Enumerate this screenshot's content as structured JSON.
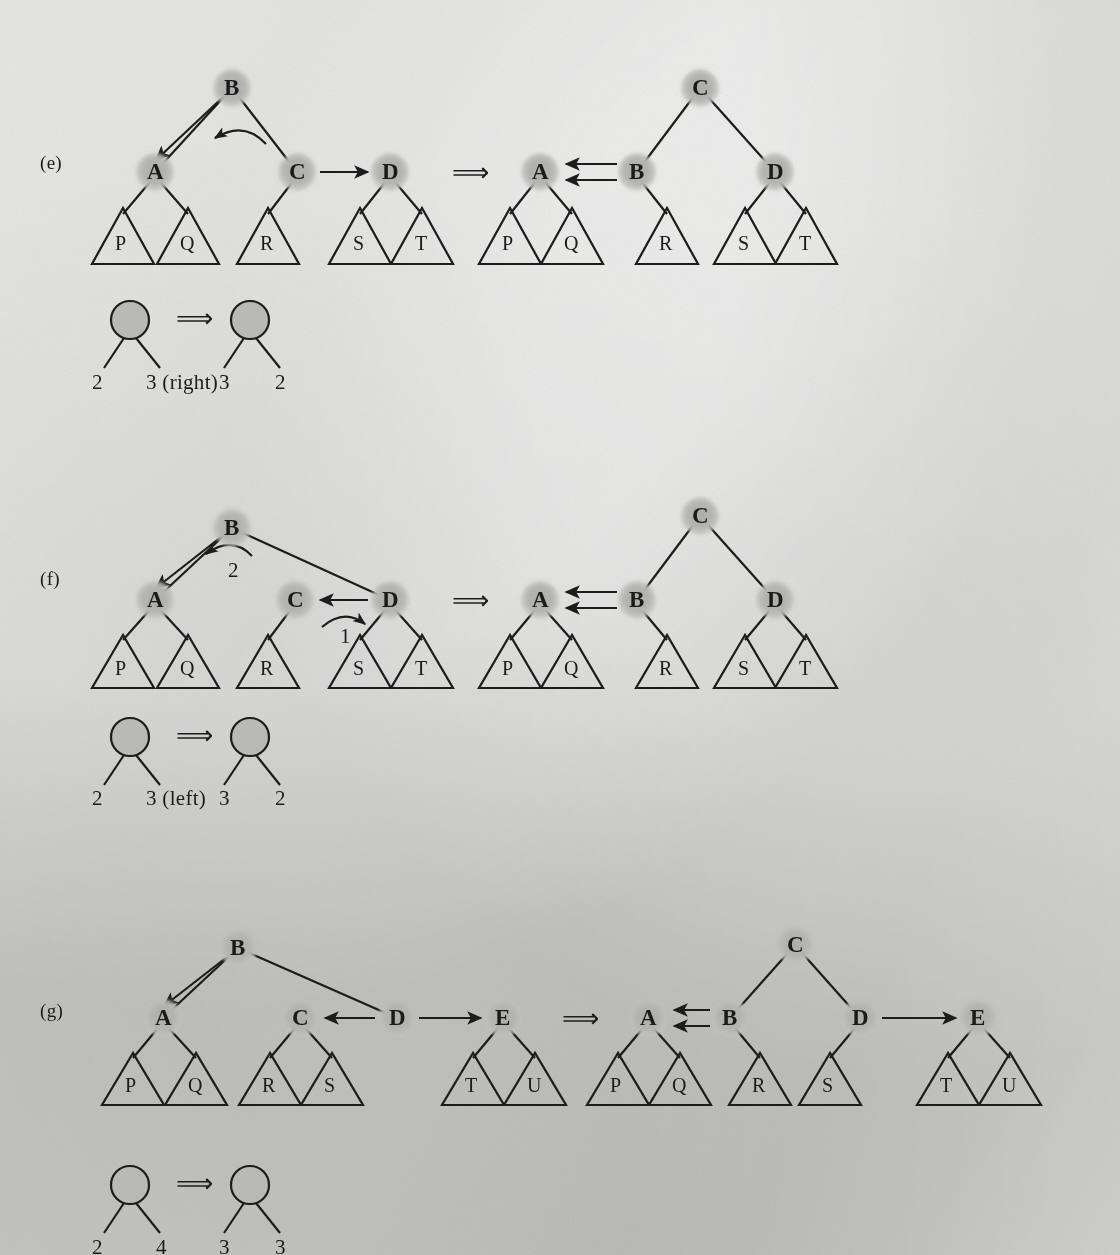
{
  "figure": {
    "kind": "avl-rebalancing-rotation-diagram",
    "background_hex": "#d2d2d0",
    "node_fill_hex": "#b4b4b2",
    "ink_hex": "#1b1b1b",
    "implies_symbol": "⟹"
  },
  "panels": [
    {
      "id": "e",
      "label": "(e)",
      "before": {
        "nodes": [
          "B",
          "A",
          "C",
          "D"
        ],
        "subtrees": [
          "P",
          "Q",
          "R",
          "S",
          "T"
        ],
        "arrows": [
          {
            "name": "b-to-a-straight",
            "from": "B",
            "to": "A",
            "style": "straight"
          },
          {
            "name": "b-self-curve",
            "from": "B",
            "to": "B",
            "style": "curved",
            "label": ""
          },
          {
            "name": "c-to-d",
            "from": "C",
            "to": "D",
            "style": "straight"
          }
        ]
      },
      "after": {
        "root": "C",
        "nodes": [
          "C",
          "A",
          "B",
          "D"
        ],
        "subtrees": [
          "P",
          "Q",
          "R",
          "S",
          "T"
        ],
        "arrows": [
          {
            "name": "b-to-a-upper",
            "from": "B",
            "to": "A",
            "style": "straight"
          },
          {
            "name": "b-to-a-lower",
            "from": "B",
            "to": "A",
            "style": "straight"
          }
        ]
      },
      "legend": {
        "before_left": "2",
        "before_right": "3 (right)",
        "after_left": "3",
        "after_right": "2"
      }
    },
    {
      "id": "f",
      "label": "(f)",
      "before": {
        "nodes": [
          "B",
          "A",
          "C",
          "D"
        ],
        "subtrees": [
          "P",
          "Q",
          "R",
          "S",
          "T"
        ],
        "arrows": [
          {
            "name": "b-to-a-straight",
            "from": "B",
            "to": "A",
            "style": "straight"
          },
          {
            "name": "b-self-curve",
            "from": "B",
            "to": "B",
            "style": "curved",
            "label": "2"
          },
          {
            "name": "d-to-c",
            "from": "D",
            "to": "C",
            "style": "straight"
          },
          {
            "name": "c-to-d-curve",
            "from": "C",
            "to": "D",
            "style": "curved",
            "label": "1"
          }
        ]
      },
      "after": {
        "root": "C",
        "nodes": [
          "C",
          "A",
          "B",
          "D"
        ],
        "subtrees": [
          "P",
          "Q",
          "R",
          "S",
          "T"
        ],
        "arrows": [
          {
            "name": "b-to-a-upper",
            "from": "B",
            "to": "A",
            "style": "straight"
          },
          {
            "name": "b-to-a-lower",
            "from": "B",
            "to": "A",
            "style": "straight"
          }
        ]
      },
      "legend": {
        "before_left": "2",
        "before_right": "3 (left)",
        "after_left": "3",
        "after_right": "2"
      }
    },
    {
      "id": "g",
      "label": "(g)",
      "before": {
        "nodes": [
          "B",
          "A",
          "C",
          "D",
          "E"
        ],
        "subtrees": [
          "P",
          "Q",
          "R",
          "S",
          "T",
          "U"
        ],
        "arrows": [
          {
            "name": "b-to-a-straight",
            "from": "B",
            "to": "A",
            "style": "straight"
          },
          {
            "name": "d-to-c",
            "from": "D",
            "to": "C",
            "style": "straight"
          },
          {
            "name": "d-to-e",
            "from": "D",
            "to": "E",
            "style": "straight"
          }
        ]
      },
      "after": {
        "root": "C",
        "nodes": [
          "C",
          "A",
          "B",
          "D",
          "E"
        ],
        "subtrees": [
          "P",
          "Q",
          "R",
          "S",
          "T",
          "U"
        ],
        "arrows": [
          {
            "name": "b-to-a-upper",
            "from": "B",
            "to": "A",
            "style": "straight"
          },
          {
            "name": "b-to-a-lower",
            "from": "B",
            "to": "A",
            "style": "straight"
          },
          {
            "name": "d-to-e",
            "from": "D",
            "to": "E",
            "style": "straight"
          }
        ]
      },
      "legend": {
        "before_left": "2",
        "before_right": "4",
        "after_left": "3",
        "after_right": "3"
      }
    }
  ]
}
